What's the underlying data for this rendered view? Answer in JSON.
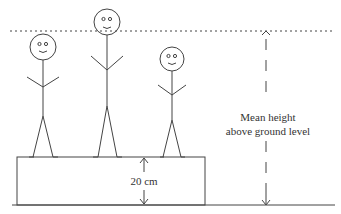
{
  "diagram": {
    "title": "",
    "labels": {
      "platform_height": "20 cm",
      "mean_height_line1": "Mean height",
      "mean_height_line2": "above ground level"
    },
    "elements": {
      "figures_count": 3,
      "platform": "box on ground",
      "reference_line": "dotted line at mean height"
    },
    "colors": {
      "stroke": "#333333",
      "background": "#ffffff"
    }
  }
}
